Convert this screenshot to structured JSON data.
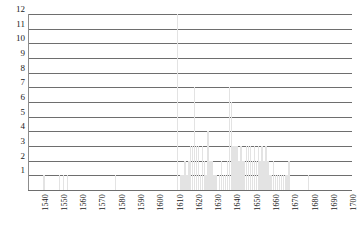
{
  "chart_data": {
    "type": "bar",
    "title": "",
    "subtitle": "",
    "xlabel": "",
    "ylabel": "",
    "grid": true,
    "legend": null,
    "xlim": [
      1535,
      1703
    ],
    "ylim": [
      0,
      12
    ],
    "ytick_labels": [
      "12",
      "11",
      "10",
      "9",
      "8",
      "7",
      "6",
      "5",
      "4",
      "3",
      "2",
      "1"
    ],
    "ytick_values": [
      12,
      11,
      10,
      9,
      8,
      7,
      6,
      5,
      4,
      3,
      2,
      1
    ],
    "xtick_labels": [
      "1540",
      "1550",
      "1560",
      "1570",
      "1580",
      "1590",
      "1600",
      "1610",
      "1620",
      "1630",
      "1640",
      "1650",
      "1660",
      "1670",
      "1680",
      "1690",
      "1700"
    ],
    "xtick_values": [
      1540,
      1550,
      1560,
      1570,
      1580,
      1590,
      1600,
      1610,
      1620,
      1630,
      1640,
      1650,
      1660,
      1670,
      1680,
      1690,
      1700
    ],
    "bar_color": "#e3e3e3",
    "gridline_color": "#6e6e6e",
    "categories": [
      1536,
      1537,
      1538,
      1539,
      1540,
      1541,
      1542,
      1543,
      1544,
      1545,
      1546,
      1547,
      1548,
      1549,
      1550,
      1551,
      1552,
      1553,
      1554,
      1555,
      1556,
      1557,
      1558,
      1559,
      1560,
      1561,
      1562,
      1563,
      1564,
      1565,
      1566,
      1567,
      1568,
      1569,
      1570,
      1571,
      1572,
      1573,
      1574,
      1575,
      1576,
      1577,
      1578,
      1579,
      1580,
      1581,
      1582,
      1583,
      1584,
      1585,
      1586,
      1587,
      1588,
      1589,
      1590,
      1591,
      1592,
      1593,
      1594,
      1595,
      1596,
      1597,
      1598,
      1599,
      1600,
      1601,
      1602,
      1603,
      1604,
      1605,
      1606,
      1607,
      1608,
      1609,
      1610,
      1611,
      1612,
      1613,
      1614,
      1615,
      1616,
      1617,
      1618,
      1619,
      1620,
      1621,
      1622,
      1623,
      1624,
      1625,
      1626,
      1627,
      1628,
      1629,
      1630,
      1631,
      1632,
      1633,
      1634,
      1635,
      1636,
      1637,
      1638,
      1639,
      1640,
      1641,
      1642,
      1643,
      1644,
      1645,
      1646,
      1647,
      1648,
      1649,
      1650,
      1651,
      1652,
      1653,
      1654,
      1655,
      1656,
      1657,
      1658,
      1659,
      1660,
      1661,
      1662,
      1663,
      1664,
      1665,
      1666,
      1667,
      1668,
      1669,
      1670,
      1671,
      1672,
      1673,
      1674,
      1675,
      1676,
      1677,
      1678,
      1679,
      1680,
      1681,
      1682,
      1683,
      1684,
      1685,
      1686,
      1687,
      1688,
      1689,
      1690,
      1691,
      1692,
      1693,
      1694,
      1695,
      1696,
      1697,
      1698,
      1699,
      1700
    ],
    "values": [
      0,
      0,
      0,
      0,
      0,
      0,
      0,
      1,
      0,
      0,
      0,
      0,
      0,
      0,
      0,
      1,
      0,
      1,
      0,
      1,
      0,
      0,
      0,
      0,
      0,
      0,
      0,
      0,
      0,
      0,
      0,
      0,
      0,
      0,
      0,
      0,
      0,
      0,
      0,
      0,
      0,
      0,
      0,
      0,
      1,
      0,
      0,
      0,
      0,
      0,
      0,
      0,
      0,
      0,
      0,
      0,
      0,
      0,
      0,
      0,
      0,
      0,
      0,
      0,
      0,
      0,
      0,
      0,
      0,
      0,
      0,
      0,
      0,
      0,
      0,
      0,
      12,
      0,
      1,
      1,
      2,
      1,
      2,
      3,
      3,
      7,
      3,
      3,
      1,
      3,
      2,
      1,
      4,
      2,
      2,
      1,
      1,
      0,
      1,
      2,
      1,
      1,
      2,
      7,
      6,
      3,
      3,
      3,
      2,
      3,
      2,
      2,
      3,
      3,
      3,
      2,
      3,
      2,
      3,
      2,
      3,
      2,
      3,
      2,
      1,
      1,
      2,
      1,
      1,
      1,
      1,
      1,
      1,
      1,
      2,
      0,
      0,
      0,
      0,
      0,
      0,
      0,
      0,
      0,
      1,
      0,
      0,
      0,
      0,
      0,
      0,
      0,
      0,
      0,
      0,
      0,
      0,
      0,
      0,
      0,
      0,
      0,
      0,
      0,
      0
    ]
  }
}
